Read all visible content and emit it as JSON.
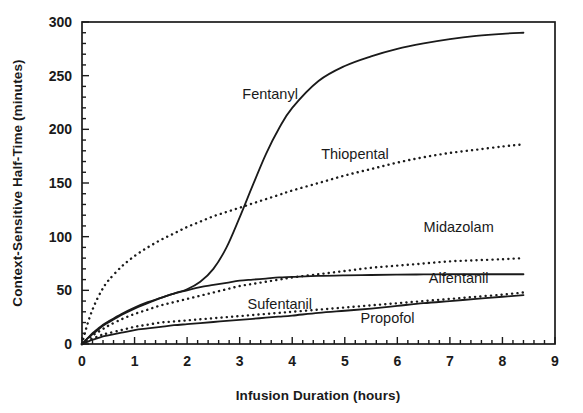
{
  "chart_data": {
    "type": "line",
    "title": "",
    "xlabel": "Infusion Duration (hours)",
    "ylabel": "Context-Sensitive Half-Time (minutes)",
    "xlim": [
      0,
      9
    ],
    "ylim": [
      0,
      300
    ],
    "xticks": [
      0,
      1,
      2,
      3,
      4,
      5,
      6,
      7,
      8,
      9
    ],
    "xtick_labels": [
      "0",
      "1",
      "2",
      "3",
      "4",
      "5",
      "6",
      "7",
      "8",
      "9"
    ],
    "yticks": [
      0,
      50,
      100,
      150,
      200,
      250,
      300
    ],
    "ytick_labels": [
      "0",
      "50",
      "100",
      "150",
      "200",
      "250",
      "300"
    ],
    "x_minor_tick_interval": 0.2,
    "y_minor_tick_interval": 10,
    "grid": false,
    "legend_position": "inline-annotations",
    "x": [
      0,
      0.1,
      0.2,
      0.3,
      0.4,
      0.5,
      0.75,
      1,
      1.25,
      1.5,
      1.75,
      2,
      2.25,
      2.5,
      2.75,
      3,
      3.25,
      3.5,
      3.75,
      4,
      4.5,
      5,
      5.5,
      6,
      6.5,
      7,
      7.5,
      8,
      8.4
    ],
    "series": [
      {
        "name": "Fentanyl",
        "linestyle": "solid",
        "color": "#1a1a1a",
        "values": [
          0,
          5,
          9,
          13,
          17,
          20,
          27,
          33,
          38,
          43,
          47,
          51,
          58,
          70,
          90,
          118,
          148,
          177,
          201,
          220,
          245,
          259,
          268,
          275,
          280,
          284,
          287,
          289,
          290
        ],
        "label_x": 3.05,
        "label_y": 228
      },
      {
        "name": "Thiopental",
        "linestyle": "dotted",
        "color": "#1a1a1a",
        "values": [
          0,
          18,
          32,
          43,
          52,
          59,
          72,
          82,
          90,
          97,
          103,
          109,
          114,
          119,
          123,
          127,
          131,
          135,
          139,
          143,
          150,
          157,
          163,
          169,
          174,
          178,
          181,
          184,
          186
        ],
        "label_x": 4.55,
        "label_y": 172
      },
      {
        "name": "Midazolam",
        "linestyle": "dotted",
        "color": "#1a1a1a",
        "values": [
          0,
          4,
          8,
          11,
          14,
          17,
          23,
          28,
          32,
          36,
          39,
          42,
          45,
          48,
          51,
          54,
          56,
          58,
          60,
          62,
          65,
          68,
          71,
          73,
          75,
          77,
          78,
          79,
          80
        ],
        "label_x": 6.5,
        "label_y": 104
      },
      {
        "name": "Alfentanil",
        "linestyle": "solid",
        "color": "#1a1a1a",
        "values": [
          0,
          5,
          10,
          14,
          18,
          21,
          28,
          34,
          39,
          43,
          47,
          50,
          53,
          55,
          57,
          59,
          60,
          61,
          62,
          62.5,
          63.5,
          64,
          64.3,
          64.6,
          64.8,
          65,
          65,
          65,
          65
        ],
        "label_x": 6.6,
        "label_y": 57
      },
      {
        "name": "Sufentanil",
        "linestyle": "dotted",
        "color": "#1a1a1a",
        "values": [
          0,
          3,
          5,
          7,
          9,
          10,
          13,
          16,
          18,
          20,
          21,
          22,
          23,
          24,
          25,
          26,
          27,
          28,
          29,
          30,
          32,
          34,
          36,
          38,
          40,
          42,
          44,
          46,
          48
        ],
        "label_x": 3.15,
        "label_y": 33
      },
      {
        "name": "Propofol",
        "linestyle": "solid",
        "color": "#1a1a1a",
        "values": [
          0,
          2,
          4,
          5.5,
          7,
          8,
          10.5,
          13,
          14.5,
          16,
          17.5,
          18.5,
          19.5,
          20.5,
          21.5,
          22.5,
          23.5,
          24.5,
          25.5,
          26.5,
          29,
          31,
          33,
          35.5,
          38,
          40,
          42,
          44,
          45.5
        ],
        "label_x": 5.3,
        "label_y": 20
      }
    ]
  },
  "labels": {
    "fentanyl": "Fentanyl",
    "thiopental": "Thiopental",
    "midazolam": "Midazolam",
    "alfentanil": "Alfentanil",
    "sufentanil": "Sufentanil",
    "propofol": "Propofol",
    "xlabel": "Infusion Duration (hours)",
    "ylabel": "Context-Sensitive Half-Time (minutes)",
    "x0": "0",
    "x1": "1",
    "x2": "2",
    "x3": "3",
    "x4": "4",
    "x5": "5",
    "x6": "6",
    "x7": "7",
    "x8": "8",
    "x9": "9",
    "y0": "0",
    "y50": "50",
    "y100": "100",
    "y150": "150",
    "y200": "200",
    "y250": "250",
    "y300": "300"
  }
}
